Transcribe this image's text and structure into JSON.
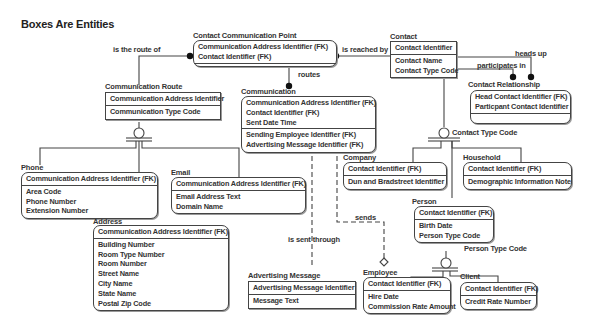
{
  "diagram": {
    "title": "Boxes Are Entities",
    "entities": {
      "contact_communication_point": {
        "name": "Contact Communication Point",
        "key": [
          "Communication Address Identifier (FK)",
          "Contact Identifier (FK)"
        ],
        "attributes": []
      },
      "contact": {
        "name": "Contact",
        "key": [
          "Contact Identifier"
        ],
        "attributes": [
          "Contact Name",
          "Contact Type Code"
        ]
      },
      "contact_relationship": {
        "name": "Contact Relationship",
        "key": [
          "Head Contact Identifier (FK)",
          "Particpant Contact Identifier"
        ],
        "attributes": []
      },
      "communication_route": {
        "name": "Communication Route",
        "key": [
          "Communication Address Identifier"
        ],
        "attributes": [
          "Communication Type Code"
        ]
      },
      "communication": {
        "name": "Communication",
        "key": [
          "Communication Address Identifier (FK)",
          "Contact Identifier (FK)",
          "Sent Date Time"
        ],
        "attributes": [
          "Sending Employee Identifier (FK)",
          "Advertising Message Identifier (FK)"
        ]
      },
      "phone": {
        "name": "Phone",
        "key": [
          "Communication Address Identifier (FK)"
        ],
        "attributes": [
          "Area Code",
          "Phone Number",
          "Extension Number"
        ]
      },
      "email": {
        "name": "Email",
        "key": [
          "Communication Address Identifier (FK)"
        ],
        "attributes": [
          "Email Address Text",
          "Domain Name"
        ]
      },
      "address": {
        "name": "Address",
        "key": [
          "Communication Address Identifier (FK)"
        ],
        "attributes": [
          "Building Number",
          "Room Type Number",
          "Room Number",
          "Street Name",
          "City Name",
          "State Name",
          "Postal Zip Code"
        ]
      },
      "company": {
        "name": "Company",
        "key": [
          "Contact Identifier (FK)"
        ],
        "attributes": [
          "Dun and Bradstreet Identifier"
        ]
      },
      "household": {
        "name": "Household",
        "key": [
          "Contact Identifier (FK)"
        ],
        "attributes": [
          "Demographic Information Note"
        ]
      },
      "person": {
        "name": "Person",
        "key": [
          "Contact Identifier (FK)"
        ],
        "attributes": [
          "Birth Date",
          "Person Type Code"
        ]
      },
      "advertising_message": {
        "name": "Advertising Message",
        "key": [
          "Advertising Message Identifier"
        ],
        "attributes": [
          "Message Text"
        ]
      },
      "employee": {
        "name": "Employee",
        "key": [
          "Contact Identifier (FK)"
        ],
        "attributes": [
          "Hire Date",
          "Commission Rate Amount"
        ]
      },
      "client": {
        "name": "Client",
        "key": [
          "Contact Identifier (FK)"
        ],
        "attributes": [
          "Credit Rate Number"
        ]
      }
    },
    "relationships": {
      "is_the_route_of": "is the route of",
      "is_reached_by": "is reached by",
      "heads_up": "heads up",
      "participates_in": "participates in",
      "routes": "routes",
      "sends": "sends",
      "is_sent_through": "is sent through"
    },
    "discriminators": {
      "contact_type_code": "Contact Type Code",
      "person_type_code": "Person Type Code"
    }
  }
}
